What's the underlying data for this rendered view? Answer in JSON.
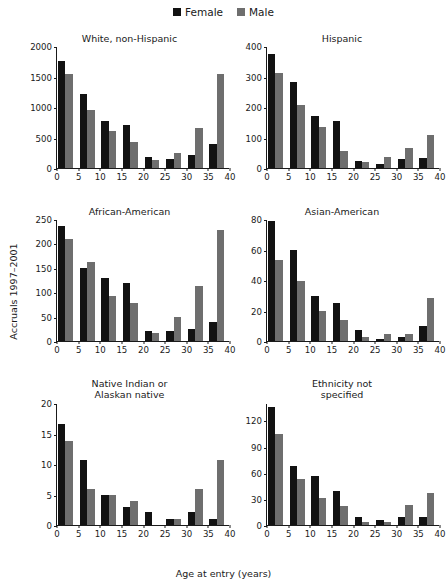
{
  "figure": {
    "ylabel": "Accruals 1997–2001",
    "xlabel": "Age at entry (years)"
  },
  "legend": {
    "items": [
      {
        "label": "Female",
        "color": "#121212"
      },
      {
        "label": "Male",
        "color": "#6e6e6e"
      }
    ]
  },
  "chart_data": [
    {
      "type": "bar",
      "title": "White, non-Hispanic",
      "xlabel": "Age at entry (years)",
      "ylabel": "Accruals 1997–2001",
      "categories": [
        "0–5",
        "5–10",
        "10–15",
        "15–20",
        "20–25",
        "25–30",
        "30–35",
        "35–40"
      ],
      "x": [
        2.5,
        7.5,
        12.5,
        17.5,
        22.5,
        27.5,
        32.5,
        37.5
      ],
      "series": [
        {
          "name": "Female",
          "color": "#121212",
          "values": [
            1750,
            1220,
            770,
            700,
            185,
            145,
            215,
            400
          ]
        },
        {
          "name": "Male",
          "color": "#6e6e6e",
          "values": [
            1540,
            950,
            615,
            425,
            135,
            245,
            660,
            1540
          ]
        }
      ],
      "yticks": [
        0,
        500,
        1000,
        1500,
        2000
      ],
      "ylim": [
        0,
        2000
      ],
      "xticks": [
        0,
        5,
        10,
        15,
        20,
        25,
        30,
        35,
        40
      ],
      "xlim": [
        0,
        40
      ],
      "grid": false,
      "legend_position": "top-center"
    },
    {
      "type": "bar",
      "title": "Hispanic",
      "xlabel": "Age at entry (years)",
      "ylabel": "Accruals 1997–2001",
      "categories": [
        "0–5",
        "5–10",
        "10–15",
        "15–20",
        "20–25",
        "25–30",
        "30–35",
        "35–40"
      ],
      "x": [
        2.5,
        7.5,
        12.5,
        17.5,
        22.5,
        27.5,
        32.5,
        37.5
      ],
      "series": [
        {
          "name": "Female",
          "color": "#121212",
          "values": [
            375,
            282,
            170,
            153,
            22,
            13,
            31,
            34
          ]
        },
        {
          "name": "Male",
          "color": "#6e6e6e",
          "values": [
            310,
            208,
            133,
            57,
            21,
            37,
            67,
            107
          ]
        }
      ],
      "yticks": [
        0,
        100,
        200,
        300,
        400
      ],
      "ylim": [
        0,
        400
      ],
      "xticks": [
        0,
        5,
        10,
        15,
        20,
        25,
        30,
        35,
        40
      ],
      "xlim": [
        0,
        40
      ],
      "grid": false
    },
    {
      "type": "bar",
      "title": "African-American",
      "xlabel": "Age at entry (years)",
      "ylabel": "Accruals 1997–2001",
      "categories": [
        "0–5",
        "5–10",
        "10–15",
        "15–20",
        "20–25",
        "25–30",
        "30–35",
        "35–40"
      ],
      "x": [
        2.5,
        7.5,
        12.5,
        17.5,
        22.5,
        27.5,
        32.5,
        37.5
      ],
      "series": [
        {
          "name": "Female",
          "color": "#121212",
          "values": [
            236,
            150,
            130,
            119,
            20,
            20,
            24,
            39
          ]
        },
        {
          "name": "Male",
          "color": "#6e6e6e",
          "values": [
            209,
            161,
            93,
            77,
            17,
            50,
            112,
            228
          ]
        }
      ],
      "yticks": [
        0,
        50,
        100,
        150,
        200,
        250
      ],
      "ylim": [
        0,
        250
      ],
      "xticks": [
        0,
        5,
        10,
        15,
        20,
        25,
        30,
        35,
        40
      ],
      "xlim": [
        0,
        40
      ],
      "grid": false
    },
    {
      "type": "bar",
      "title": "Asian-American",
      "xlabel": "Age at entry (years)",
      "ylabel": "Accruals 1997–2001",
      "categories": [
        "0–5",
        "5–10",
        "10–15",
        "15–20",
        "20–25",
        "25–30",
        "30–35",
        "35–40"
      ],
      "x": [
        2.5,
        7.5,
        12.5,
        17.5,
        22.5,
        27.5,
        32.5,
        37.5
      ],
      "series": [
        {
          "name": "Female",
          "color": "#121212",
          "values": [
            79,
            60,
            29.5,
            25,
            7.5,
            1,
            2.5,
            10
          ]
        },
        {
          "name": "Male",
          "color": "#6e6e6e",
          "values": [
            53,
            39.5,
            19.5,
            13.5,
            2.5,
            4.5,
            4.5,
            28.5
          ]
        }
      ],
      "yticks": [
        0,
        20,
        40,
        60,
        80
      ],
      "ylim": [
        0,
        80
      ],
      "xticks": [
        0,
        5,
        10,
        15,
        20,
        25,
        30,
        35,
        40
      ],
      "xlim": [
        0,
        40
      ],
      "grid": false
    },
    {
      "type": "bar",
      "title": "Native Indian or\nAlaskan native",
      "xlabel": "Age at entry (years)",
      "ylabel": "Accruals 1997–2001",
      "categories": [
        "0–5",
        "5–10",
        "10–15",
        "15–20",
        "20–25",
        "25–30",
        "30–35",
        "35–40"
      ],
      "x": [
        2.5,
        7.5,
        12.5,
        17.5,
        22.5,
        27.5,
        32.5,
        37.5
      ],
      "series": [
        {
          "name": "Female",
          "color": "#121212",
          "values": [
            16.6,
            10.7,
            4.9,
            3,
            2.1,
            1,
            2.1,
            1
          ]
        },
        {
          "name": "Male",
          "color": "#6e6e6e",
          "values": [
            13.7,
            5.9,
            4.9,
            4,
            0,
            1,
            5.9,
            10.7
          ]
        }
      ],
      "yticks": [
        0,
        5,
        10,
        15,
        20
      ],
      "ylim": [
        0,
        20
      ],
      "xticks": [
        0,
        5,
        10,
        15,
        20,
        25,
        30,
        35,
        40
      ],
      "xlim": [
        0,
        40
      ],
      "grid": false
    },
    {
      "type": "bar",
      "title": "Ethnicity not\nspecified",
      "xlabel": "Age at entry (years)",
      "ylabel": "Accruals 1997–2001",
      "categories": [
        "0–5",
        "5–10",
        "10–15",
        "15–20",
        "20–25",
        "25–30",
        "30–35",
        "35–40"
      ],
      "x": [
        2.5,
        7.5,
        12.5,
        17.5,
        22.5,
        27.5,
        32.5,
        37.5
      ],
      "series": [
        {
          "name": "Female",
          "color": "#121212",
          "values": [
            135,
            68,
            56,
            39,
            9,
            6,
            9,
            9
          ]
        },
        {
          "name": "Male",
          "color": "#6e6e6e",
          "values": [
            105,
            53,
            31,
            22,
            3.5,
            4,
            23,
            37
          ]
        }
      ],
      "yticks": [
        0,
        30,
        60,
        90,
        120
      ],
      "ylim": [
        0,
        140
      ],
      "xticks": [
        0,
        5,
        10,
        15,
        20,
        25,
        30,
        35,
        40
      ],
      "xlim": [
        0,
        40
      ],
      "grid": false
    }
  ]
}
